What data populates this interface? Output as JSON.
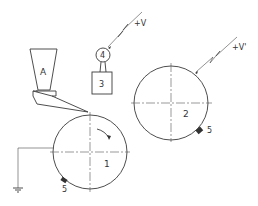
{
  "diagram": {
    "type": "technical-schematic",
    "hopper": {
      "label": "A"
    },
    "voltage_source_top": {
      "label": "+V"
    },
    "voltage_source_right": {
      "label": "+V'"
    },
    "meter": {
      "label": "4"
    },
    "box": {
      "label": "3"
    },
    "drum_1": {
      "label": "1"
    },
    "drum_2": {
      "label": "2"
    },
    "electrode_1": {
      "label": "5"
    },
    "electrode_2": {
      "label": "5"
    },
    "ground": {
      "label": ""
    }
  },
  "colors": {
    "line": "#3a3a3a",
    "background": "#ffffff"
  }
}
